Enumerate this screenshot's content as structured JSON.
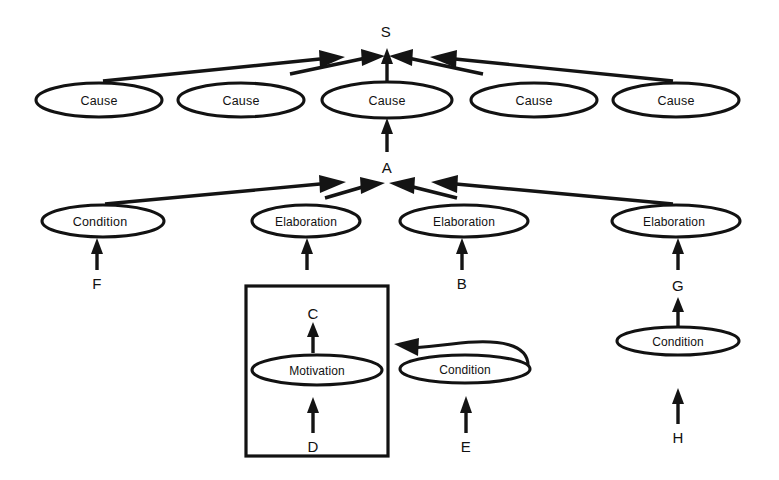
{
  "diagram": {
    "background_color": "#ffffff",
    "stroke_color": "#121212",
    "nodes": [
      {
        "id": "S",
        "label": "S",
        "kind": "text-node",
        "cx": 386,
        "cy": 31
      },
      {
        "id": "C1",
        "label": "Cause",
        "kind": "ellipse",
        "cx": 99,
        "cy": 100,
        "rx": 63,
        "ry": 17
      },
      {
        "id": "C2",
        "label": "Cause",
        "kind": "ellipse",
        "cx": 241,
        "cy": 100,
        "rx": 63,
        "ry": 17
      },
      {
        "id": "C3",
        "label": "Cause",
        "kind": "ellipse",
        "cx": 387,
        "cy": 100,
        "rx": 65,
        "ry": 18
      },
      {
        "id": "C4",
        "label": "Cause",
        "kind": "ellipse",
        "cx": 534,
        "cy": 100,
        "rx": 63,
        "ry": 17
      },
      {
        "id": "C5",
        "label": "Cause",
        "kind": "ellipse",
        "cx": 676,
        "cy": 100,
        "rx": 63,
        "ry": 17
      },
      {
        "id": "A",
        "label": "A",
        "kind": "text-node",
        "cx": 387,
        "cy": 167
      },
      {
        "id": "N1",
        "label": "Condition",
        "kind": "ellipse",
        "cx": 103,
        "cy": 221,
        "rx": 61,
        "ry": 16
      },
      {
        "id": "N2",
        "label": "Elaboration",
        "kind": "ellipse",
        "cx": 306,
        "cy": 221,
        "rx": 54,
        "ry": 16
      },
      {
        "id": "N3",
        "label": "Elaboration",
        "kind": "ellipse",
        "cx": 464,
        "cy": 221,
        "rx": 64,
        "ry": 16
      },
      {
        "id": "N4",
        "label": "Elaboration",
        "kind": "ellipse",
        "cx": 676,
        "cy": 221,
        "rx": 64,
        "ry": 16
      },
      {
        "id": "F",
        "label": "F",
        "kind": "text-node",
        "cx": 97,
        "cy": 283
      },
      {
        "id": "B",
        "label": "B",
        "kind": "text-node",
        "cx": 462,
        "cy": 283
      },
      {
        "id": "G",
        "label": "G",
        "kind": "text-node",
        "cx": 678,
        "cy": 285
      },
      {
        "id": "C",
        "label": "C",
        "kind": "text-node",
        "cx": 313,
        "cy": 313
      },
      {
        "id": "M1",
        "label": "Motivation",
        "kind": "ellipse",
        "cx": 317,
        "cy": 370,
        "rx": 65,
        "ry": 15
      },
      {
        "id": "D",
        "label": "D",
        "kind": "text-node",
        "cx": 313,
        "cy": 446
      },
      {
        "id": "N5",
        "label": "Condition",
        "kind": "ellipse",
        "cx": 465,
        "cy": 369,
        "rx": 65,
        "ry": 14
      },
      {
        "id": "E",
        "label": "E",
        "kind": "text-node",
        "cx": 466,
        "cy": 446
      },
      {
        "id": "N6",
        "label": "Condition",
        "kind": "ellipse",
        "cx": 678,
        "cy": 341,
        "rx": 61,
        "ry": 14
      },
      {
        "id": "H",
        "label": "H",
        "kind": "text-node",
        "cx": 678,
        "cy": 437
      }
    ],
    "group_box": {
      "label": "motivation-group-box",
      "x": 246,
      "y": 286,
      "width": 142,
      "height": 170
    },
    "edges": [
      {
        "from": "C1",
        "to": "S",
        "style": "long-diagonal-right"
      },
      {
        "from": "C2",
        "to": "S",
        "style": "short-diagonal-right"
      },
      {
        "from": "C3",
        "to": "S",
        "style": "vertical"
      },
      {
        "from": "C4",
        "to": "S",
        "style": "short-diagonal-left"
      },
      {
        "from": "C5",
        "to": "S",
        "style": "long-diagonal-left"
      },
      {
        "from": "A",
        "to": "C3",
        "style": "vertical"
      },
      {
        "from": "N1",
        "to": "A",
        "style": "long-diagonal-right"
      },
      {
        "from": "N2",
        "to": "A",
        "style": "short-diagonal-right"
      },
      {
        "from": "N3",
        "to": "A",
        "style": "short-diagonal-left"
      },
      {
        "from": "N4",
        "to": "A",
        "style": "long-diagonal-left"
      },
      {
        "from": "F",
        "to": "N1",
        "style": "vertical"
      },
      {
        "from": "C",
        "to": "N2",
        "style": "vertical"
      },
      {
        "from": "B",
        "to": "N3",
        "style": "vertical"
      },
      {
        "from": "G",
        "to": "N4",
        "style": "vertical"
      },
      {
        "from": "M1",
        "to": "C",
        "style": "vertical"
      },
      {
        "from": "D",
        "to": "M1",
        "style": "vertical"
      },
      {
        "from": "N5",
        "to": "group_box",
        "style": "curved-left"
      },
      {
        "from": "E",
        "to": "N5",
        "style": "vertical"
      },
      {
        "from": "N6",
        "to": "G",
        "style": "vertical"
      },
      {
        "from": "H",
        "to": "N6",
        "style": "vertical"
      }
    ]
  }
}
